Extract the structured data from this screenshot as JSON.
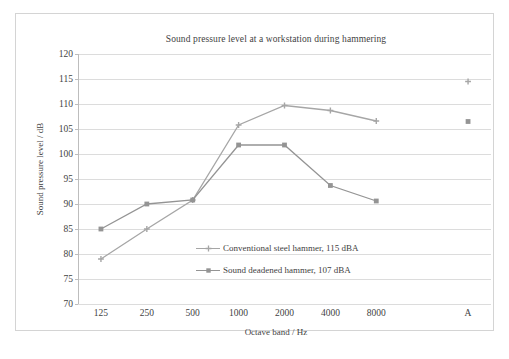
{
  "chart_data": {
    "type": "line",
    "title": "Sound pressure level at a workstation during hammering",
    "xlabel": "Octave band / Hz",
    "ylabel": "Sound pressure level / dB",
    "categories": [
      "125",
      "250",
      "500",
      "1000",
      "2000",
      "4000",
      "8000",
      "",
      "A"
    ],
    "ylim": [
      70,
      120
    ],
    "ytick_step": 5,
    "yticks": [
      "120",
      "115",
      "110",
      "105",
      "100",
      "95",
      "90",
      "85",
      "80",
      "75",
      "70"
    ],
    "grid": true,
    "legend_position": "inside-center",
    "series": [
      {
        "name": "Conventional steel hammer, 115 dBA",
        "color": "#a6a6a6",
        "marker": "cross",
        "values": [
          79.0,
          85.0,
          90.8,
          105.8,
          109.7,
          108.7,
          106.6,
          null,
          114.5
        ],
        "overall_dBA": 115
      },
      {
        "name": "Sound deadened hammer, 107 dBA",
        "color": "#949494",
        "marker": "square",
        "values": [
          85.0,
          90.0,
          90.8,
          101.8,
          101.8,
          93.7,
          90.6,
          null,
          106.5
        ],
        "overall_dBA": 107
      }
    ],
    "annotations": []
  },
  "figure": {
    "title": "Sound pressure level at a workstation during hammering",
    "x_axis_title": "Octave band / Hz",
    "y_axis_title": "Sound pressure level / dB",
    "caption_ghost": ""
  },
  "legend": {
    "entries": [
      {
        "label": "Conventional steel hammer, 115 dBA",
        "marker": "cross-marker"
      },
      {
        "label": "Sound deadened hammer, 107 dBA",
        "marker": "square-marker"
      }
    ]
  },
  "colors": {
    "series_steel": "#a6a6a6",
    "series_deadened": "#949494",
    "gridline": "#dcdcdc",
    "axis": "#bdbdbd",
    "frame": "#d4d4d4",
    "text": "#3f3f3f"
  }
}
